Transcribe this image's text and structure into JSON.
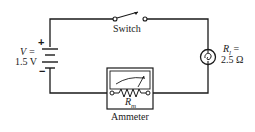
{
  "diagram": {
    "type": "circuit-schematic",
    "components": {
      "battery": {
        "symbol_label": "V =",
        "value_label": "1.5 V",
        "plus": "+",
        "minus": "−"
      },
      "switch": {
        "label": "Switch",
        "state": "open"
      },
      "lamp": {
        "symbol_label": "R_l =",
        "symbol_main": "R",
        "symbol_sub": "l",
        "equals": " =",
        "value_label": "2.5 Ω"
      },
      "ammeter": {
        "label": "Ammeter",
        "resistor_main": "R",
        "resistor_sub": "m"
      }
    },
    "colors": {
      "wire": "#1a1a1a",
      "background": "#ffffff"
    }
  }
}
